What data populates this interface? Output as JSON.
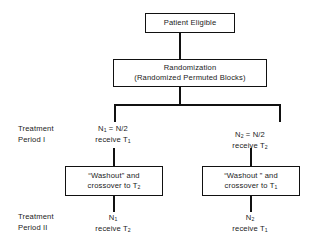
{
  "diagram": {
    "type": "flowchart",
    "background_color": "#ffffff",
    "line_color": "#111111",
    "text_color": "#1a1a1a"
  },
  "nodes": {
    "patient_eligible": {
      "label": "Patient Eligible"
    },
    "randomization": {
      "line1": "Randomization",
      "line2": "(Randomized Permuted Blocks)"
    },
    "washout_left": {
      "line1": "“Washout” and",
      "line2_prefix": "crossover to T",
      "line2_sub": "2"
    },
    "washout_right": {
      "line1": "“Washout ” and",
      "line2_prefix": "crossover to T",
      "line2_sub": "1"
    }
  },
  "row_labels": {
    "period_1": {
      "line1": "Treatment",
      "line2": "Period I"
    },
    "period_2": {
      "line1": "Treatment",
      "line2": "Period II"
    }
  },
  "arms": {
    "left_period_1": {
      "line1_prefix": "N",
      "line1_sub": "1",
      "line1_suffix": " = N/2",
      "line2_prefix": "receive T",
      "line2_sub": "1"
    },
    "right_period_1": {
      "line1_prefix": "N",
      "line1_sub": "2",
      "line1_suffix": " = N/2",
      "line2_prefix": "receive T",
      "line2_sub": "2"
    },
    "left_period_2": {
      "line1_prefix": "N",
      "line1_sub": "1",
      "line2_prefix": "receive T",
      "line2_sub": "2"
    },
    "right_period_2": {
      "line1_prefix": "N",
      "line1_sub": "2",
      "line2_prefix": "receive T",
      "line2_sub": "1"
    }
  }
}
